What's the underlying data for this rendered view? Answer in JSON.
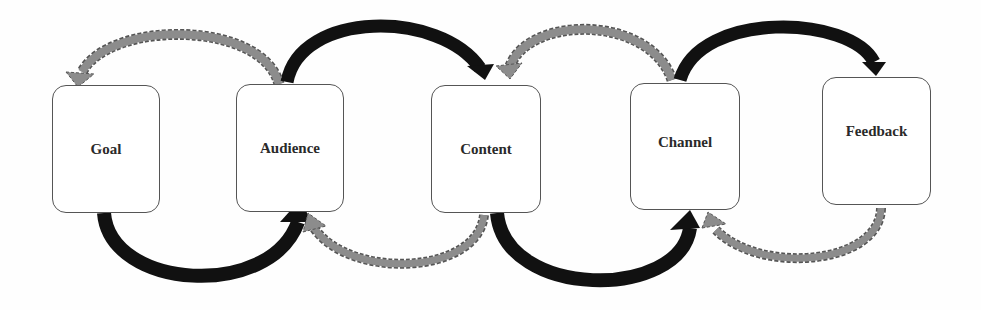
{
  "diagram": {
    "type": "flow",
    "nodes": [
      {
        "id": "goal",
        "label": "Goal",
        "x": 52,
        "y": 85,
        "w": 108,
        "h": 128,
        "label_dy": 0
      },
      {
        "id": "audience",
        "label": "Audience",
        "x": 236,
        "y": 84,
        "w": 108,
        "h": 128,
        "label_dy": 0
      },
      {
        "id": "content",
        "label": "Content",
        "x": 431,
        "y": 85,
        "w": 110,
        "h": 128,
        "label_dy": 0
      },
      {
        "id": "channel",
        "label": "Channel",
        "x": 630,
        "y": 83,
        "w": 110,
        "h": 127,
        "label_dy": -4
      },
      {
        "id": "feedback",
        "label": "Feedback",
        "x": 822,
        "y": 77,
        "w": 109,
        "h": 128,
        "label_dy": -10
      }
    ],
    "edges": [
      {
        "from": "goal",
        "to": "audience",
        "style": "solid-black",
        "position": "bottom"
      },
      {
        "from": "audience",
        "to": "goal",
        "style": "dashed-gray",
        "position": "top"
      },
      {
        "from": "audience",
        "to": "content",
        "style": "solid-black",
        "position": "top"
      },
      {
        "from": "content",
        "to": "audience",
        "style": "dashed-gray",
        "position": "bottom"
      },
      {
        "from": "content",
        "to": "channel",
        "style": "solid-black",
        "position": "bottom"
      },
      {
        "from": "channel",
        "to": "content",
        "style": "dashed-gray",
        "position": "top"
      },
      {
        "from": "channel",
        "to": "feedback",
        "style": "solid-black",
        "position": "top"
      },
      {
        "from": "feedback",
        "to": "channel",
        "style": "dashed-gray",
        "position": "bottom"
      }
    ],
    "colors": {
      "forward_arrow": "#111111",
      "feedback_arrow": "#8c8c8c",
      "feedback_arrow_outline": "#555555",
      "box_border": "#555555",
      "box_fill": "#ffffff",
      "label": "#2a2a2a"
    }
  }
}
